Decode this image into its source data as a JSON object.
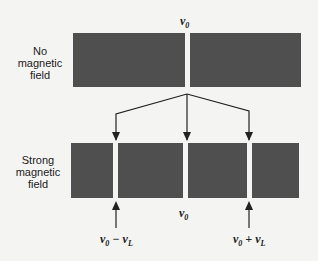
{
  "labels": {
    "no_field": [
      "No",
      "magnetic",
      "field"
    ],
    "strong_field": [
      "Strong",
      "magnetic",
      "field"
    ]
  },
  "frequencies": {
    "top_center": "ν₀",
    "bottom_center": "ν₀",
    "left": "ν₀ − ν_L",
    "right": "ν₀ + ν_L"
  },
  "colors": {
    "band": "#4f4f4f",
    "background": "#f4f4f2",
    "line": "#222222"
  }
}
